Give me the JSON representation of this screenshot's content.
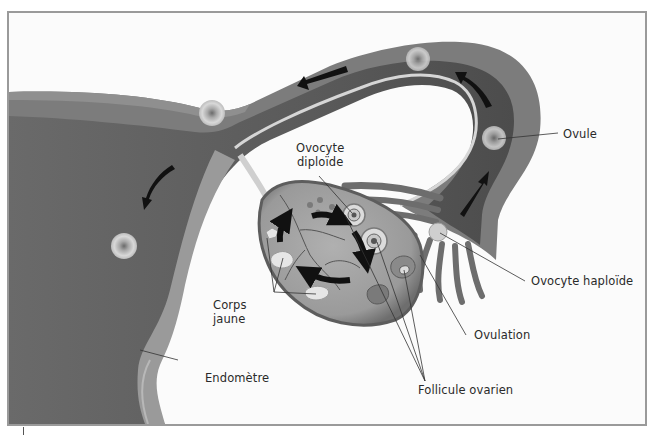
{
  "diagram": {
    "title": "",
    "colors": {
      "frame_border": "#9a9a9a",
      "tissue_dark": "#5b5b5b",
      "tissue_mid": "#7a7a7a",
      "endometrium": "#8c8c8c",
      "ovary": "#9b9b9b",
      "arrow": "#111111",
      "leader_line": "#333333",
      "text": "#2a2a2a"
    },
    "labels": {
      "ovocyte_diploide": "Ovocyte\ndiploïde",
      "ovocyte_diploide_line1": "Ovocyte",
      "ovocyte_diploide_line2": "diploïde",
      "ovule": "Ovule",
      "ovocyte_haploide": "Ovocyte haploïde",
      "corps_jaune_line1": "Corps",
      "corps_jaune_line2": "jaune",
      "ovulation": "Ovulation",
      "endometre": "Endomètre",
      "follicule_ovarien": "Follicule ovarien"
    },
    "structures": [
      "uterus",
      "fallopian-tube",
      "fimbriae",
      "ovary",
      "endometrium"
    ],
    "arrows": [
      {
        "location": "tube-top-left",
        "direction": "left"
      },
      {
        "location": "tube-top-right",
        "direction": "up-left"
      },
      {
        "location": "tube-right",
        "direction": "up"
      },
      {
        "location": "uterus-left",
        "direction": "down-left"
      },
      {
        "location": "ovary-cycle",
        "direction": "clockwise",
        "count": 4
      }
    ]
  }
}
